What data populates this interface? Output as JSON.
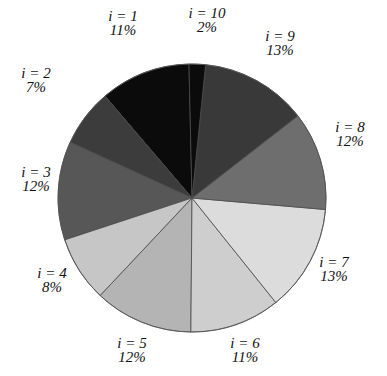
{
  "chart_data": {
    "type": "pie",
    "title": "",
    "start_angle_deg": -1.3,
    "direction": "counterclockwise",
    "center": [
      192,
      198
    ],
    "radius": 134,
    "slices": [
      {
        "label": "i = 1",
        "pct_label": "11%",
        "value": 11,
        "color": "#0b0b0b",
        "label_pos": [
          123,
          21
        ]
      },
      {
        "label": "i = 2",
        "pct_label": "7%",
        "value": 7,
        "color": "#3c3c3c",
        "label_pos": [
          36,
          78
        ]
      },
      {
        "label": "i = 3",
        "pct_label": "12%",
        "value": 12,
        "color": "#575757",
        "label_pos": [
          36,
          177
        ]
      },
      {
        "label": "i = 4",
        "pct_label": "8%",
        "value": 8,
        "color": "#c6c6c6",
        "label_pos": [
          52,
          278
        ]
      },
      {
        "label": "i = 5",
        "pct_label": "12%",
        "value": 12,
        "color": "#b4b4b4",
        "label_pos": [
          132,
          348
        ]
      },
      {
        "label": "i = 6",
        "pct_label": "11%",
        "value": 11,
        "color": "#cecece",
        "label_pos": [
          245,
          348
        ]
      },
      {
        "label": "i = 7",
        "pct_label": "13%",
        "value": 13,
        "color": "#dcdcdc",
        "label_pos": [
          334,
          267
        ]
      },
      {
        "label": "i = 8",
        "pct_label": "12%",
        "value": 12,
        "color": "#6e6e6e",
        "label_pos": [
          350,
          132
        ]
      },
      {
        "label": "i = 9",
        "pct_label": "13%",
        "value": 13,
        "color": "#393939",
        "label_pos": [
          280,
          41
        ]
      },
      {
        "label": "i = 10",
        "pct_label": "2%",
        "value": 2,
        "color": "#0b0b0b",
        "label_pos": [
          207,
          18
        ]
      }
    ],
    "legend": "none",
    "grid": false
  }
}
